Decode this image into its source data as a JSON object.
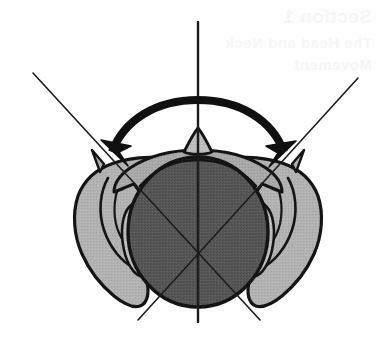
{
  "figure": {
    "background_color": "#fefefe",
    "ink_color": "#1a1a1a"
  },
  "ghost_text": {
    "note": "faint bleed-through text from reverse of scanned page, top-right",
    "lines": [
      "Section 1",
      "The Head and Neck",
      "Movement"
    ]
  },
  "colors": {
    "outline": "#141414",
    "head_fill": "#565656",
    "shoulder_fill": "#b2b2b2",
    "ear_fill": "#bdbdbd",
    "hair_fill": "#a8a8a8",
    "arrow_fill": "#101010",
    "axis_line": "#1c1c1c",
    "background": "#fefefe"
  },
  "geometry": {
    "canvas": {
      "width": 386,
      "height": 340
    },
    "rotation_center": {
      "x": 198,
      "y": 258
    },
    "head_center": {
      "x": 198,
      "y": 232
    },
    "head_radius_x": 70,
    "head_radius_y": 75
  },
  "axis_lines": [
    {
      "name": "midline-vertical-axis",
      "x1": 198,
      "y1": 22,
      "x2": 198,
      "y2": 322,
      "stroke_width": 2.2
    },
    {
      "name": "left-rotation-axis",
      "x1": 33,
      "y1": 73,
      "x2": 260,
      "y2": 320,
      "stroke_width": 1.5
    },
    {
      "name": "right-rotation-axis",
      "x1": 358,
      "y1": 78,
      "x2": 138,
      "y2": 320,
      "stroke_width": 1.5
    }
  ],
  "rotation_arrow": {
    "name": "bidirectional-rotation-arrow",
    "type": "double-headed-curved-arc",
    "arc_center": {
      "x": 198,
      "y": 250
    },
    "arc_radius": 128,
    "start_angle_deg": 228,
    "end_angle_deg": 312,
    "left_head_tip": {
      "x": 101,
      "y": 140
    },
    "right_head_tip": {
      "x": 296,
      "y": 141
    },
    "head_length": 26,
    "head_width": 17,
    "meaning": "range of head rotation to left and right"
  },
  "labels": {
    "visible_text_present": false,
    "caption": ""
  }
}
